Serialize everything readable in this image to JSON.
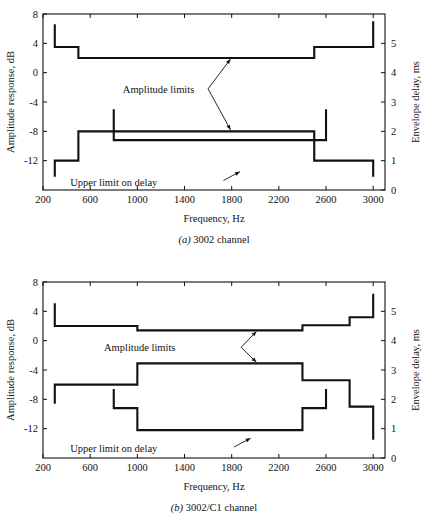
{
  "figure": {
    "panels": [
      {
        "id": "panel-a",
        "caption_label": "(a)",
        "caption_text": "3002 channel",
        "chart_data": {
          "type": "line",
          "title": "3002 channel",
          "xlabel": "Frequency, Hz",
          "ylabel": "Amplitude response, dB",
          "y2label": "Envelope delay, ms",
          "xlim": [
            200,
            3100
          ],
          "ylim": [
            -16,
            8
          ],
          "y2lim": [
            0,
            6
          ],
          "grid": false,
          "legend": "none",
          "xticks": [
            200,
            600,
            1000,
            1400,
            1800,
            2200,
            2600,
            3000
          ],
          "yticks": [
            8,
            4,
            0,
            -4,
            -8,
            -12
          ],
          "y2ticks": [
            0,
            1,
            2,
            3,
            4,
            5
          ],
          "series": [
            {
              "name": "Upper amplitude limit",
              "axis": "left",
              "units": "dB",
              "points": [
                [
                  300,
                  6.6
                ],
                [
                  300,
                  3.5
                ],
                [
                  500,
                  3.5
                ],
                [
                  500,
                  2.0
                ],
                [
                  2500,
                  2.0
                ],
                [
                  2500,
                  3.5
                ],
                [
                  3000,
                  3.5
                ],
                [
                  3000,
                  7.0
                ]
              ]
            },
            {
              "name": "Lower amplitude limit",
              "axis": "left",
              "units": "dB",
              "points": [
                [
                  300,
                  -14.2
                ],
                [
                  300,
                  -12.0
                ],
                [
                  500,
                  -12.0
                ],
                [
                  500,
                  -8.0
                ],
                [
                  2500,
                  -8.0
                ],
                [
                  2500,
                  -12.0
                ],
                [
                  3000,
                  -12.0
                ],
                [
                  3000,
                  -14.2
                ]
              ]
            },
            {
              "name": "Upper limit on delay",
              "axis": "right",
              "units": "ms",
              "points": [
                [
                  800,
                  2.75
                ],
                [
                  800,
                  1.7
                ],
                [
                  2600,
                  1.7
                ],
                [
                  2600,
                  2.75
                ]
              ]
            }
          ],
          "annotations": [
            {
              "name": "amplitude-limits",
              "text": "Amplitude limits",
              "text_x": 1180,
              "text_y": -2.2,
              "arrows": [
                {
                  "from_x": 1600,
                  "from_y": -2.2,
                  "to_x": 1790,
                  "to_y": 1.85
                },
                {
                  "from_x": 1600,
                  "from_y": -2.2,
                  "to_x": 1790,
                  "to_y": -7.8
                }
              ]
            },
            {
              "name": "upper-limit-on-delay",
              "text": "Upper limit on delay",
              "text_x": 800,
              "text_y": -14.9,
              "arrows": [
                {
                  "from_x": 1730,
                  "from_y": -14.7,
                  "to_x": 1870,
                  "to_y": -13.5
                }
              ]
            }
          ]
        }
      },
      {
        "id": "panel-b",
        "caption_label": "(b)",
        "caption_text": "3002/C1 channel",
        "chart_data": {
          "type": "line",
          "title": "3002/C1 channel",
          "xlabel": "Frequency, Hz",
          "ylabel": "Amplitude response, dB",
          "y2label": "Envelope delay, ms",
          "xlim": [
            200,
            3100
          ],
          "ylim": [
            -16,
            8
          ],
          "y2lim": [
            0,
            6
          ],
          "grid": false,
          "legend": "none",
          "xticks": [
            200,
            600,
            1000,
            1400,
            1800,
            2200,
            2600,
            3000
          ],
          "yticks": [
            8,
            4,
            0,
            -4,
            -8,
            -12
          ],
          "y2ticks": [
            0,
            1,
            2,
            3,
            4,
            5
          ],
          "series": [
            {
              "name": "Upper amplitude limit",
              "axis": "left",
              "units": "dB",
              "points": [
                [
                  300,
                  5.1
                ],
                [
                  300,
                  2.0
                ],
                [
                  1000,
                  2.0
                ],
                [
                  1000,
                  1.4
                ],
                [
                  2400,
                  1.4
                ],
                [
                  2400,
                  2.1
                ],
                [
                  2800,
                  2.1
                ],
                [
                  2800,
                  3.2
                ],
                [
                  3000,
                  3.2
                ],
                [
                  3000,
                  6.4
                ]
              ]
            },
            {
              "name": "Lower amplitude limit",
              "axis": "left",
              "units": "dB",
              "points": [
                [
                  300,
                  -8.6
                ],
                [
                  300,
                  -6.0
                ],
                [
                  1000,
                  -6.0
                ],
                [
                  1000,
                  -3.1
                ],
                [
                  2400,
                  -3.1
                ],
                [
                  2400,
                  -5.4
                ],
                [
                  2800,
                  -5.4
                ],
                [
                  2800,
                  -9.0
                ],
                [
                  3000,
                  -9.0
                ],
                [
                  3000,
                  -13.5
                ]
              ]
            },
            {
              "name": "Upper limit on delay",
              "axis": "right",
              "units": "ms",
              "points": [
                [
                  800,
                  2.35
                ],
                [
                  800,
                  1.7
                ],
                [
                  1000,
                  1.7
                ],
                [
                  1000,
                  0.95
                ],
                [
                  2400,
                  0.95
                ],
                [
                  2400,
                  1.7
                ],
                [
                  2600,
                  1.7
                ],
                [
                  2600,
                  2.35
                ]
              ]
            }
          ],
          "annotations": [
            {
              "name": "amplitude-limits",
              "text": "Amplitude limits",
              "text_x": 1020,
              "text_y": -0.9,
              "arrows": [
                {
                  "from_x": 1880,
                  "from_y": -0.9,
                  "to_x": 2010,
                  "to_y": 1.25
                },
                {
                  "from_x": 1880,
                  "from_y": -0.9,
                  "to_x": 2010,
                  "to_y": -2.95
                }
              ]
            },
            {
              "name": "upper-limit-on-delay",
              "text": "Upper limit on delay",
              "text_x": 800,
              "text_y": -14.7,
              "arrows": [
                {
                  "from_x": 1820,
                  "from_y": -14.5,
                  "to_x": 1960,
                  "to_y": -13.3
                }
              ]
            }
          ]
        }
      }
    ]
  }
}
